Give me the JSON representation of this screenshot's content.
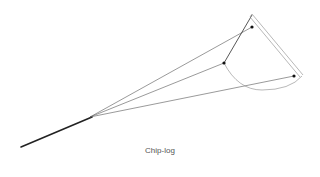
{
  "caption": "Chip-log",
  "colors": {
    "line": "#333333",
    "thin_line": "#555555",
    "frame": "#888888",
    "arc": "#888888",
    "dot": "#111111"
  },
  "diagram": {
    "parts": [
      "log-line",
      "bridle-cords",
      "quadrant-board",
      "pins"
    ]
  }
}
